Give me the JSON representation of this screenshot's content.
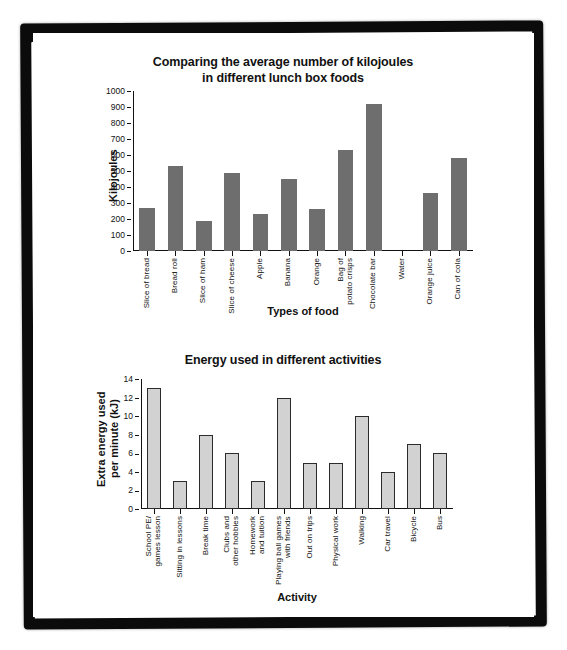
{
  "page": {
    "background": "#ffffff",
    "frame_color": "#0b0b0b"
  },
  "chart_data": [
    {
      "id": "kilojoules-chart",
      "type": "bar",
      "title": "Comparing the average number of kilojoules\nin different lunch box foods",
      "title_line1": "Comparing the average number of kilojoules",
      "title_line2": "in different lunch box foods",
      "xlabel": "Types of food",
      "ylabel": "Kilojoules",
      "ylim": [
        0,
        1000
      ],
      "ytick_step": 100,
      "yticks": [
        "0",
        "100",
        "200",
        "300",
        "400",
        "500",
        "600",
        "700",
        "800",
        "900",
        "1000"
      ],
      "grid": false,
      "legend": "none",
      "bar_color": "#6e6e6e",
      "categories": [
        "Slice of bread",
        "Bread roll",
        "Slice of ham",
        "Slice of cheese",
        "Apple",
        "Banana",
        "Orange",
        "Bag of\npotato crisps",
        "Chocolate bar",
        "Water",
        "Orange juice",
        "Can of cola"
      ],
      "values": [
        270,
        530,
        190,
        490,
        230,
        450,
        265,
        630,
        920,
        0,
        360,
        580
      ]
    },
    {
      "id": "energy-chart",
      "type": "bar",
      "title": "Energy used in different activities",
      "xlabel": "Activity",
      "ylabel": "Extra energy used\nper minute (kJ)",
      "ylabel_line1": "Extra energy used",
      "ylabel_line2": "per minute (kJ)",
      "ylim": [
        0,
        14
      ],
      "ytick_step": 2,
      "yticks": [
        "0",
        "2",
        "4",
        "6",
        "8",
        "10",
        "12",
        "14"
      ],
      "grid": false,
      "legend": "none",
      "bar_color": "#d2d2d2",
      "bar_edge_color": "#2b2b2b",
      "categories": [
        "School PE/\ngames lesson",
        "Sitting in lessons",
        "Break time",
        "Clubs and\nother hobbies",
        "Homework\nand tuition",
        "Playing ball games\nwith friends",
        "Out on trips",
        "Physical work",
        "Walking",
        "Car travel",
        "Bicycle",
        "Bus"
      ],
      "values": [
        13,
        3,
        8,
        6,
        3,
        12,
        5,
        5,
        10,
        4,
        7,
        6
      ]
    }
  ]
}
